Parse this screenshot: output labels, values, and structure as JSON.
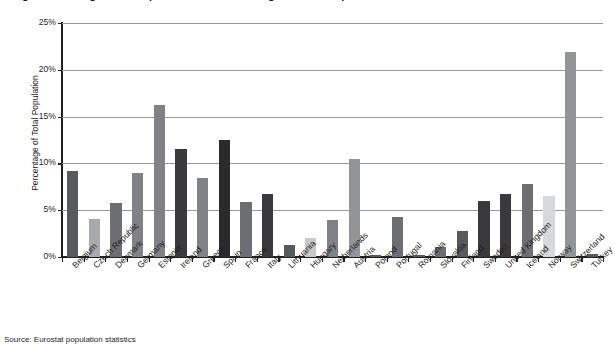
{
  "figure": {
    "title": "Figure 3. Foreign-born Population as a Percentage of Total Population",
    "source_note": "Source: Eurostat population statistics"
  },
  "chart_data": {
    "type": "bar",
    "title": "Figure 3. Foreign-born Population as a Percentage of Total Population",
    "xlabel": "",
    "ylabel": "Percentage of Total Population",
    "ylim": [
      0,
      25
    ],
    "ytick_labels": [
      "25%",
      "20%",
      "15%",
      "10%",
      "5%",
      "0%"
    ],
    "ytick_values": [
      25,
      20,
      15,
      10,
      5,
      0
    ],
    "grid": true,
    "legend": "none",
    "units": "percent",
    "categories": [
      "Belgium",
      "Czech Republic",
      "Denmark",
      "Germany",
      "Estonia",
      "Ireland",
      "Greece",
      "Spain",
      "France",
      "Italy",
      "Lithuania",
      "Hungary",
      "Netherlands",
      "Austria",
      "Poland",
      "Portugal",
      "Romania",
      "Slovakia",
      "Finland",
      "Sweden",
      "United Kingdom",
      "Iceland",
      "Norway",
      "Switzerland",
      "Turkey"
    ],
    "values": [
      9.2,
      4.1,
      5.8,
      9.0,
      16.2,
      11.5,
      8.4,
      12.5,
      5.9,
      6.7,
      1.3,
      2.0,
      4.0,
      10.5,
      0.2,
      4.3,
      0.2,
      1.1,
      2.8,
      6.0,
      6.7,
      7.8,
      6.5,
      21.9,
      0.3
    ],
    "bar_colors": [
      "#58595b",
      "#a7a9ac",
      "#6d6e71",
      "#808285",
      "#808285",
      "#3a3a3c",
      "#808285",
      "#2b2b2d",
      "#6d6e71",
      "#3a3a3c",
      "#58595b",
      "#c7c9cb",
      "#808285",
      "#929497",
      "#58595b",
      "#6d6e71",
      "#58595b",
      "#6d6e71",
      "#58595b",
      "#3a3a3c",
      "#3a3a3c",
      "#6d6e71",
      "#d6d8da",
      "#929497",
      "#58595b"
    ]
  }
}
